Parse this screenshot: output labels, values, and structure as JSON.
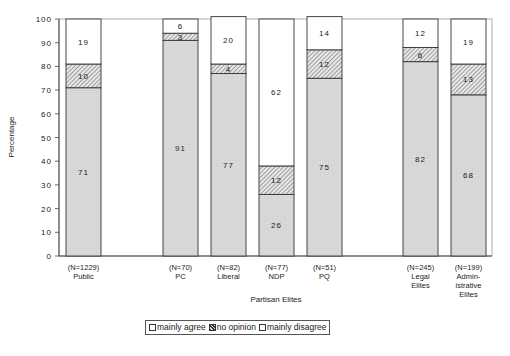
{
  "chart_data": {
    "type": "bar",
    "stacked": true,
    "title": "",
    "xlabel": "Partisan Elites",
    "ylabel": "Percentage",
    "ylim": [
      0,
      100
    ],
    "yticks": [
      0,
      10,
      20,
      30,
      40,
      50,
      60,
      70,
      80,
      90,
      100
    ],
    "grid": false,
    "legend_position": "bottom",
    "categories": [
      {
        "n": "(N=1229)",
        "label": [
          "Public"
        ]
      },
      {
        "n": "(N=70)",
        "label": [
          "PC"
        ]
      },
      {
        "n": "(N=82)",
        "label": [
          "Liberal"
        ]
      },
      {
        "n": "(N=77)",
        "label": [
          "NDP"
        ]
      },
      {
        "n": "(N=51)",
        "label": [
          "PQ"
        ]
      },
      {
        "n": "(N=245)",
        "label": [
          "Legal",
          "Elites"
        ]
      },
      {
        "n": "(N=199)",
        "label": [
          "Admin-",
          "istrative",
          "Elites"
        ]
      }
    ],
    "series": [
      {
        "name": "mainly agree",
        "pattern": "light-gray-dotted",
        "values": [
          71,
          91,
          77,
          26,
          75,
          82,
          68
        ]
      },
      {
        "name": "no opinion",
        "pattern": "diagonal-hatch",
        "values": [
          10,
          3,
          4,
          12,
          12,
          6,
          13
        ]
      },
      {
        "name": "mainly disagree",
        "pattern": "white",
        "values": [
          19,
          6,
          20,
          62,
          14,
          12,
          19
        ]
      }
    ]
  },
  "legend": {
    "items": [
      "mainly agree",
      "no opinion",
      "mainly disagree"
    ]
  },
  "colors": {
    "agree_fill": "#d9d9d9",
    "hatch_fill": "#e6e6e6",
    "hatch_line": "#555555",
    "disagree_fill": "#ffffff",
    "stroke": "#333333"
  }
}
